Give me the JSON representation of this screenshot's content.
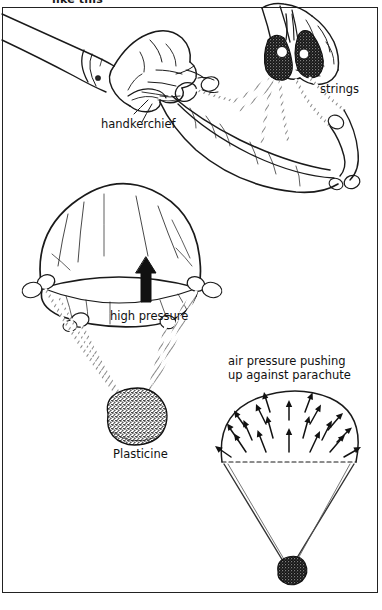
{
  "figure": {
    "title_fragment": "like this",
    "background_color": "#ffffff",
    "ink_color": "#1a1a1a",
    "border_color": "#222222",
    "labels": {
      "handkerchief": "handkerchief",
      "strings": "strings",
      "high_pressure": "high pressure",
      "plasticine": "Plasticine",
      "air_pressure_line1": "air pressure pushing",
      "air_pressure_line2": "up against parachute"
    },
    "icons": {
      "up_arrow": "up-arrow-icon",
      "pressure_arrows": "radiating-up-arrows-icon",
      "dashed_rim": "dashed-line-icon"
    },
    "panels": {
      "top": "hands tying strings to corners of a handkerchief",
      "middle": "inflated handkerchief parachute with strings and a Plasticine weight",
      "bottom_right": "schematic of air pressure pushing up against an open parachute canopy"
    }
  }
}
